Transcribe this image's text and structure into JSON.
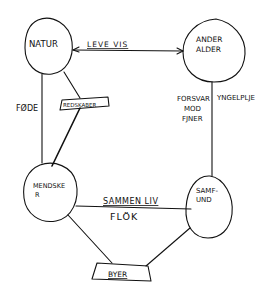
{
  "diagram": {
    "type": "hand-drawn concept map",
    "stroke_color": "#111111",
    "background": "#ffffff",
    "nodes": {
      "natur": {
        "label": "NATUR"
      },
      "ander_alder": {
        "line1": "ANDER",
        "line2": "ALDER"
      },
      "mendsker": {
        "line1": "MENDSKE",
        "line2": "R"
      },
      "samfund": {
        "line1": "SAMF-",
        "line2": "UND"
      },
      "byer": {
        "label": "BYER"
      }
    },
    "edges": {
      "natur_ander": {
        "label": "LEVE VIS"
      },
      "natur_mendsker_left": {
        "label": "FØDE"
      },
      "natur_mendsker_diag": {
        "label": "REDSKABER"
      },
      "ander_samfund_left": {
        "line1": "FORSVAR",
        "line2": "MOD",
        "line3": "FJNER"
      },
      "ander_samfund_right": {
        "label": "YNGELPLJE"
      },
      "mendsker_samfund_top": {
        "label": "SAMMEN LIV"
      },
      "mendsker_samfund_bottom": {
        "label": "FLÖK"
      }
    }
  }
}
